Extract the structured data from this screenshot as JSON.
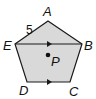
{
  "diagram": {
    "type": "pentagon",
    "fill_color": "#d9d9d9",
    "stroke_color": "#1a1a1a",
    "vertices": {
      "A": {
        "label": "A",
        "x": 48,
        "y": 21
      },
      "B": {
        "label": "B",
        "x": 82,
        "y": 44
      },
      "C": {
        "label": "C",
        "x": 70,
        "y": 82
      },
      "D": {
        "label": "D",
        "x": 27,
        "y": 82
      },
      "E": {
        "label": "E",
        "x": 15,
        "y": 44
      }
    },
    "segments": [
      "EB"
    ],
    "parallel_marks": [
      "EB",
      "DC"
    ],
    "side_length_label": {
      "side": "EA",
      "value": "5"
    },
    "point": {
      "label": "P",
      "x": 48,
      "y": 55
    }
  }
}
